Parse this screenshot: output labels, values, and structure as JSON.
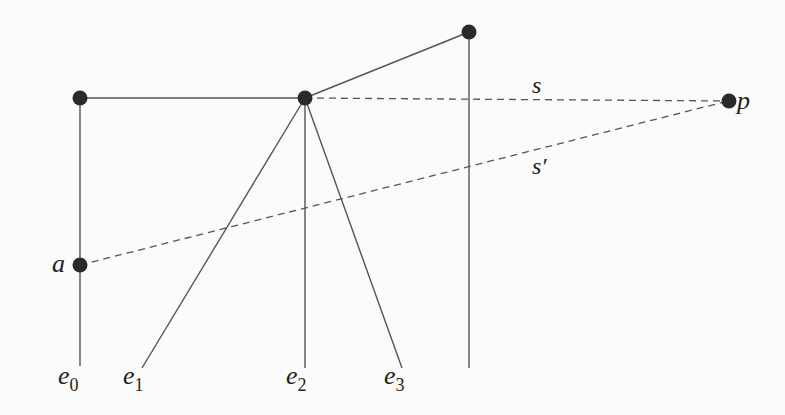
{
  "diagram": {
    "colors": {
      "stroke": "#555555",
      "node": "#2a2a2a",
      "text": "#222222",
      "background": "#fbfbfb"
    },
    "nodes": [
      {
        "id": "n_topleft",
        "x": 80,
        "y": 98
      },
      {
        "id": "n_center",
        "x": 305,
        "y": 98
      },
      {
        "id": "n_top",
        "x": 469,
        "y": 32
      },
      {
        "id": "p",
        "x": 728,
        "y": 101,
        "label": "p"
      },
      {
        "id": "a",
        "x": 80,
        "y": 265,
        "label": "a"
      }
    ],
    "solid_edges": [
      {
        "from": [
          80,
          98
        ],
        "to": [
          305,
          98
        ]
      },
      {
        "from": [
          305,
          98
        ],
        "to": [
          469,
          32
        ]
      },
      {
        "from": [
          80,
          98
        ],
        "to": [
          80,
          366
        ],
        "label": "e0"
      },
      {
        "from": [
          305,
          98
        ],
        "to": [
          142,
          368
        ],
        "label": "e1"
      },
      {
        "from": [
          305,
          98
        ],
        "to": [
          305,
          368
        ],
        "label": "e2"
      },
      {
        "from": [
          305,
          98
        ],
        "to": [
          402,
          368
        ],
        "label": "e3"
      },
      {
        "from": [
          469,
          32
        ],
        "to": [
          469,
          368
        ]
      }
    ],
    "dashed_edges": [
      {
        "from": [
          305,
          98
        ],
        "to": [
          728,
          101
        ],
        "label": "s"
      },
      {
        "from": [
          80,
          265
        ],
        "to": [
          728,
          101
        ],
        "label": "s′"
      }
    ],
    "labels": {
      "a": "a",
      "p": "p",
      "s": "s",
      "s_prime": "s′",
      "e": "e",
      "e0_sub": "0",
      "e1_sub": "1",
      "e2_sub": "2",
      "e3_sub": "3"
    }
  }
}
